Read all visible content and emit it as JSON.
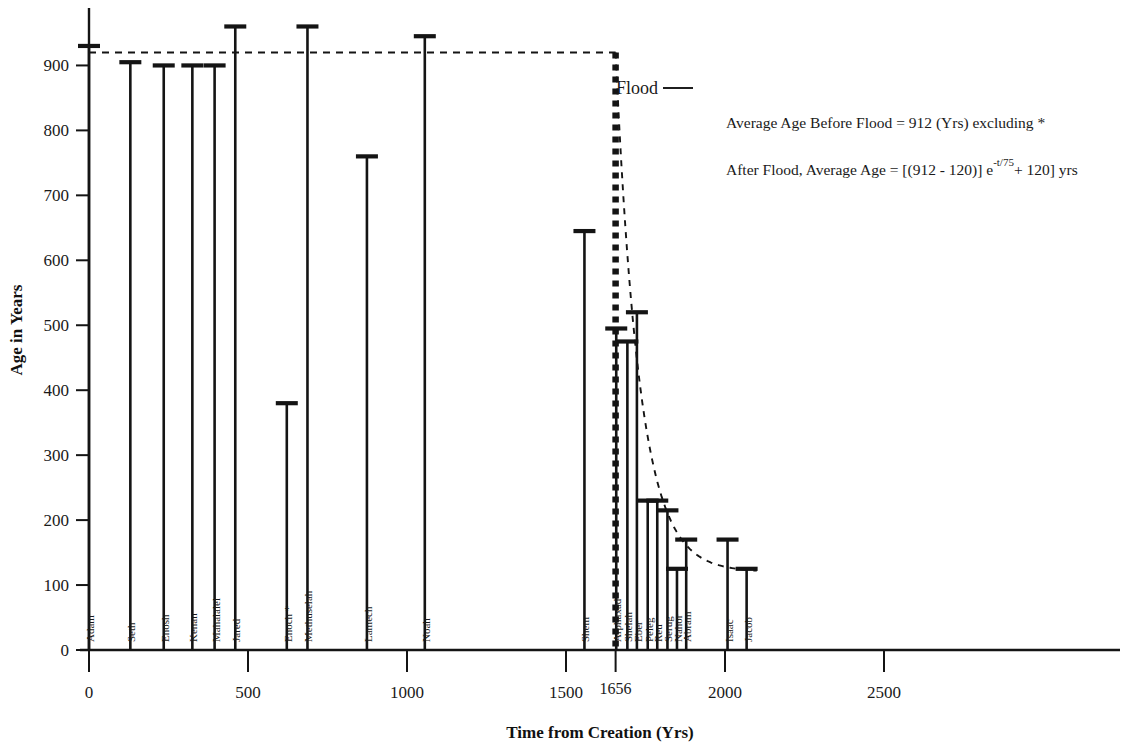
{
  "chart_data": {
    "type": "bar",
    "title": "",
    "xlabel": "Time from Creation (Yrs)",
    "ylabel": "Age in Years",
    "xlim": [
      -40,
      2750
    ],
    "ylim": [
      0,
      960
    ],
    "xticks": [
      0,
      500,
      1000,
      1500,
      2000,
      2500
    ],
    "yticks": [
      0,
      100,
      200,
      300,
      400,
      500,
      600,
      700,
      800,
      900
    ],
    "grid": false,
    "legend": null,
    "special_xtick": {
      "value": 1656,
      "label": "1656"
    },
    "categories": [
      "Adam",
      "Seth",
      "Enosh",
      "Kenan",
      "Mahalalel",
      "Jared",
      "Enoch *",
      "Methuselah",
      "Lamech",
      "Noah",
      "Shem",
      "Arphaxad",
      "Shelah",
      "Eber",
      "Peleg",
      "Reu",
      "Serug",
      "Nahor",
      "Abram",
      "Isaac",
      "Jacob"
    ],
    "x": [
      0,
      130,
      235,
      325,
      395,
      460,
      622,
      687,
      874,
      1056,
      1558,
      1658,
      1693,
      1723,
      1757,
      1787,
      1819,
      1849,
      1878,
      2008,
      2068
    ],
    "values": [
      930,
      905,
      900,
      900,
      900,
      960,
      380,
      960,
      760,
      945,
      645,
      495,
      475,
      520,
      230,
      230,
      215,
      125,
      170,
      170,
      125
    ],
    "series": [
      {
        "name": "Age at Death",
        "values": [
          930,
          905,
          900,
          900,
          900,
          960,
          380,
          960,
          760,
          645,
          495,
          475,
          520,
          230,
          230,
          215,
          125,
          170,
          170,
          125,
          945
        ]
      }
    ],
    "reference_lines": [
      {
        "name": "average-age-before-flood",
        "orientation": "horizontal",
        "value": 920,
        "style": "dashed",
        "x_end": 1656
      },
      {
        "name": "flood-event",
        "orientation": "vertical",
        "value": 1656,
        "style": "dashed-thick"
      }
    ],
    "curve": {
      "name": "post-flood-decay",
      "style": "dashed",
      "equation": "Age = (912 - 120) e^(-t/75) + 120",
      "asymptote": 120,
      "start_x": 1656,
      "start_y": 920
    }
  },
  "axes": {
    "y_title": "Age in Years",
    "x_title": "Time from Creation (Yrs)",
    "y_tick_labels": [
      "0",
      "100",
      "200",
      "300",
      "400",
      "500",
      "600",
      "700",
      "800",
      "900"
    ],
    "x_tick_labels": [
      "0",
      "500",
      "1000",
      "1500",
      "2000",
      "2500"
    ],
    "flood_tick_label": "1656"
  },
  "annotations": {
    "flood_label": "Flood",
    "line1": "Average Age Before Flood = 912 (Yrs) excluding *",
    "line2_part1": "After Flood, Average Age = [(912 - 120)] e",
    "line2_sup": "-t/75",
    "line2_part2": "+ 120] yrs"
  },
  "colors": {
    "ink": "#141414",
    "background": "#ffffff"
  }
}
